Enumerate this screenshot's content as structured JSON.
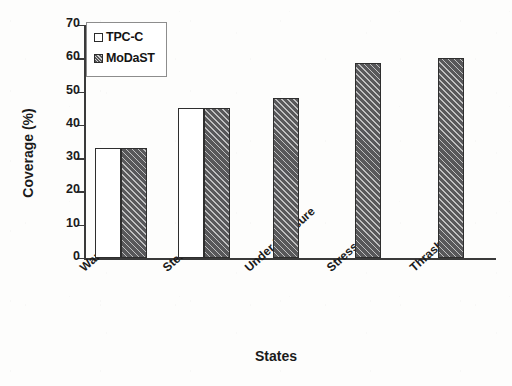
{
  "chart_data": {
    "type": "bar",
    "title": "",
    "subtitle": "",
    "xlabel": "States",
    "ylabel": "Coverage (%)",
    "categories": [
      "Warm-Up",
      "Steady",
      "Under Pressure",
      "Stress",
      "Thrashing"
    ],
    "series": [
      {
        "name": "TPC-C",
        "values": [
          33,
          45,
          0,
          0,
          0
        ],
        "fill": "#ffffff",
        "edge": "#2e2e2e",
        "pattern": "solid-white"
      },
      {
        "name": "MoDaST",
        "values": [
          33,
          45,
          48,
          58.5,
          60
        ],
        "fill": "#58585a",
        "edge": "#2e2e2e",
        "pattern": "diagonal-hatch"
      }
    ],
    "ylim": [
      0,
      70
    ],
    "yticks": [
      0,
      10,
      20,
      30,
      40,
      50,
      60,
      70
    ],
    "ytick_labels": [
      "0",
      "10",
      "20",
      "30",
      "40",
      "50",
      "60",
      "70"
    ],
    "grid": false,
    "legend_position": "upper-left-inside",
    "xtick_rotation_deg": -42
  },
  "legend": {
    "entries": [
      {
        "label": "TPC-C"
      },
      {
        "label": "MoDaST"
      }
    ]
  },
  "axes": {
    "y_title": "Coverage (%)",
    "x_title": "States"
  }
}
